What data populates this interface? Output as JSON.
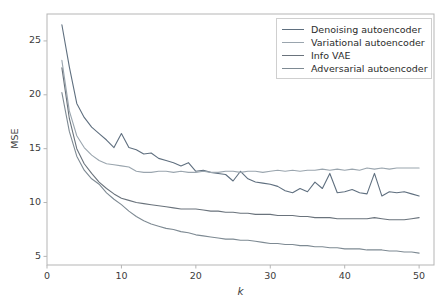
{
  "chart_data": {
    "type": "line",
    "title": "",
    "xlabel": "k",
    "ylabel": "MSE",
    "xlim": [
      0,
      52
    ],
    "ylim": [
      4.2,
      27.5
    ],
    "xticks": [
      0,
      10,
      20,
      30,
      40,
      50
    ],
    "yticks": [
      5,
      10,
      15,
      20,
      25
    ],
    "grid": false,
    "legend_position": "upper right",
    "x": [
      2,
      3,
      4,
      5,
      6,
      7,
      8,
      9,
      10,
      11,
      12,
      13,
      14,
      15,
      16,
      17,
      18,
      19,
      20,
      21,
      22,
      23,
      24,
      25,
      26,
      27,
      28,
      29,
      30,
      31,
      32,
      33,
      34,
      35,
      36,
      37,
      38,
      39,
      40,
      41,
      42,
      43,
      44,
      45,
      46,
      47,
      48,
      49,
      50
    ],
    "series": [
      {
        "name": "Denoising autoencoder",
        "color": "#5f6f7f",
        "values": [
          26.5,
          22.6,
          19.2,
          17.9,
          17.0,
          16.4,
          15.8,
          15.1,
          16.4,
          15.1,
          14.9,
          14.5,
          14.6,
          14.1,
          13.9,
          13.7,
          13.4,
          13.7,
          12.9,
          13.0,
          12.8,
          12.7,
          12.6,
          12.0,
          12.9,
          12.2,
          11.9,
          11.8,
          11.7,
          11.5,
          11.1,
          10.9,
          11.3,
          11.0,
          11.9,
          11.3,
          12.7,
          10.9,
          11.0,
          11.2,
          10.9,
          10.8,
          12.7,
          10.6,
          11.0,
          10.9,
          11.0,
          10.8,
          10.6
        ]
      },
      {
        "name": "Variational autoencoder",
        "color": "#9aa5ae",
        "values": [
          23.2,
          18.5,
          16.2,
          15.1,
          14.4,
          13.9,
          13.6,
          13.5,
          13.4,
          13.3,
          12.9,
          12.8,
          12.8,
          12.9,
          12.9,
          12.8,
          12.9,
          12.8,
          12.8,
          12.9,
          12.8,
          12.8,
          12.9,
          12.9,
          12.8,
          12.9,
          12.9,
          12.8,
          12.9,
          13.0,
          12.9,
          13.0,
          12.9,
          13.0,
          13.0,
          13.1,
          13.0,
          13.1,
          13.0,
          13.1,
          13.0,
          13.2,
          13.1,
          13.2,
          13.1,
          13.2,
          13.2,
          13.2,
          13.2
        ]
      },
      {
        "name": "Info VAE",
        "color": "#6a737c",
        "values": [
          22.5,
          17.8,
          15.0,
          13.6,
          12.7,
          11.9,
          11.3,
          10.8,
          10.4,
          10.2,
          10.0,
          9.9,
          9.8,
          9.7,
          9.6,
          9.5,
          9.4,
          9.4,
          9.4,
          9.3,
          9.2,
          9.2,
          9.1,
          9.1,
          9.0,
          9.0,
          8.9,
          8.9,
          8.9,
          8.8,
          8.8,
          8.8,
          8.7,
          8.7,
          8.6,
          8.6,
          8.6,
          8.5,
          8.5,
          8.5,
          8.5,
          8.5,
          8.6,
          8.5,
          8.4,
          8.4,
          8.4,
          8.5,
          8.6
        ]
      },
      {
        "name": "Adversarial autoencoder",
        "color": "#7e8a93",
        "values": [
          20.2,
          16.6,
          14.3,
          13.0,
          12.2,
          11.7,
          10.9,
          10.3,
          9.8,
          9.2,
          8.7,
          8.3,
          8.0,
          7.8,
          7.6,
          7.5,
          7.3,
          7.2,
          7.0,
          6.9,
          6.8,
          6.7,
          6.6,
          6.6,
          6.5,
          6.5,
          6.4,
          6.3,
          6.2,
          6.2,
          6.1,
          6.1,
          6.0,
          6.0,
          5.9,
          5.9,
          5.8,
          5.8,
          5.7,
          5.7,
          5.7,
          5.6,
          5.6,
          5.6,
          5.5,
          5.5,
          5.4,
          5.4,
          5.3
        ]
      }
    ]
  },
  "axis": {
    "ylabel_text": "MSE",
    "xlabel_text": "k",
    "ytick_labels": [
      "5",
      "10",
      "15",
      "20",
      "25"
    ],
    "xtick_labels": [
      "0",
      "10",
      "20",
      "30",
      "40",
      "50"
    ]
  },
  "legend": {
    "entries": [
      {
        "label": "Denoising autoencoder"
      },
      {
        "label": "Variational autoencoder"
      },
      {
        "label": "Info VAE"
      },
      {
        "label": "Adversarial autoencoder"
      }
    ]
  },
  "style": {
    "axis_color": "#b5b5b5",
    "text_color": "#3c3c3c",
    "background": "#ffffff"
  }
}
